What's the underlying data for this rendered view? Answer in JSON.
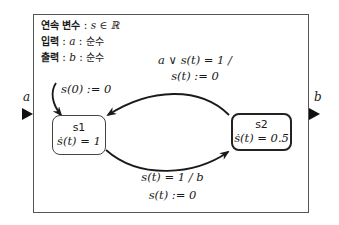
{
  "declarations": {
    "continuous_var": {
      "label": "연속 변수",
      "sep": ":",
      "expr": "s ∈ ℝ"
    },
    "input": {
      "label": "입력",
      "sep": ":",
      "var": "a",
      "type": "순수"
    },
    "output": {
      "label": "출력",
      "sep": ":",
      "var": "b",
      "type": "순수"
    }
  },
  "ports": {
    "input": {
      "name": "a"
    },
    "output": {
      "name": "b"
    }
  },
  "initial": {
    "action": "s(0) := 0"
  },
  "states": [
    {
      "id": "s1",
      "name": "s1",
      "flow": "ṡ(t) = 1"
    },
    {
      "id": "s2",
      "name": "s2",
      "flow": "ṡ(t) = 0.5"
    }
  ],
  "transitions": [
    {
      "from": "s2",
      "to": "s1",
      "guard": "a ∨ s(t) = 1 /",
      "action": "s(t) := 0"
    },
    {
      "from": "s1",
      "to": "s2",
      "guard": "s(t) = 1  /  b",
      "action": "s(t) := 0"
    }
  ],
  "colors": {
    "stroke": "#1a1a1a",
    "frame": "#555555"
  }
}
